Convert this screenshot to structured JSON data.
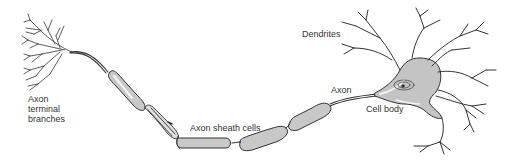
{
  "diagram": {
    "colors": {
      "outline": "#333333",
      "fill": "#c8c8c8",
      "highlight": "#f2f2f2",
      "text": "#333333"
    },
    "labels": {
      "axon_terminal": [
        "Axon",
        "terminal",
        "branches"
      ],
      "axon_sheath": "Axon sheath cells",
      "axon": "Axon",
      "dendrites": "Dendrites",
      "cell_body": "Cell body"
    },
    "parts": [
      "axon-terminal-branches",
      "axon",
      "axon-sheath-cells",
      "cell-body",
      "nucleus",
      "dendrites"
    ]
  }
}
